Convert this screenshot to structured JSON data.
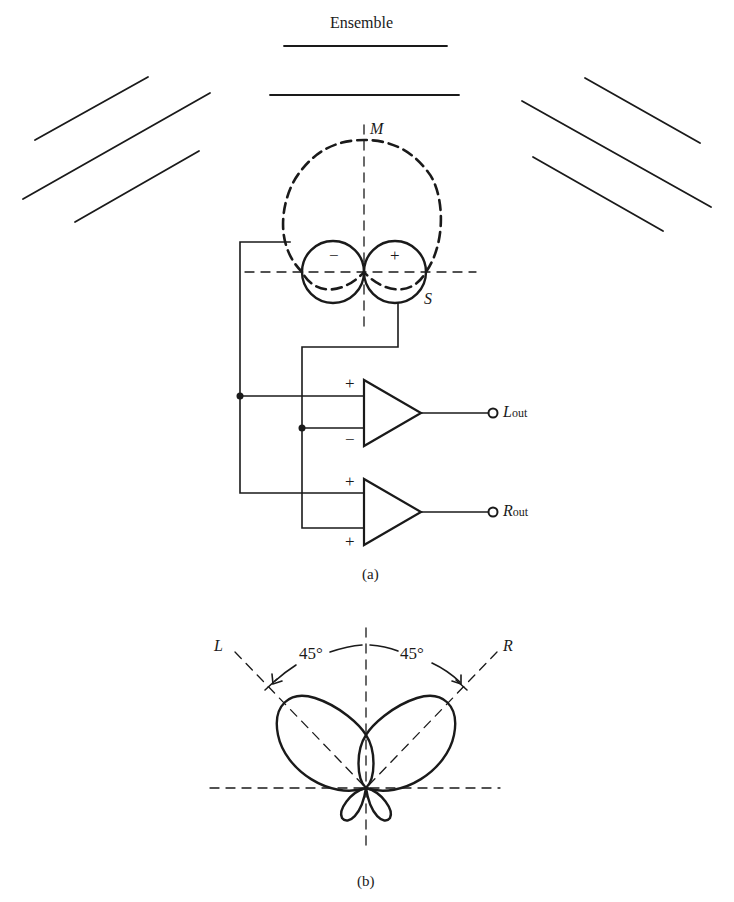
{
  "figure": {
    "title": "Ensemble",
    "colors": {
      "ink": "#1a1a1a",
      "background": "#ffffff"
    },
    "panel_a": {
      "caption": "(a)",
      "pattern_labels": {
        "mid": "M",
        "side": "S"
      },
      "figure8_signs": {
        "left": "−",
        "right": "+"
      },
      "amp_top": {
        "input_upper_sign": "+",
        "input_lower_sign": "−",
        "output_label_main": "L",
        "output_label_sub": "out"
      },
      "amp_bottom": {
        "input_upper_sign": "+",
        "input_lower_sign": "+",
        "output_label_main": "R",
        "output_label_sub": "out"
      }
    },
    "panel_b": {
      "caption": "(b)",
      "left_axis_label": "L",
      "right_axis_label": "R",
      "left_angle": "45°",
      "right_angle": "45°"
    }
  }
}
